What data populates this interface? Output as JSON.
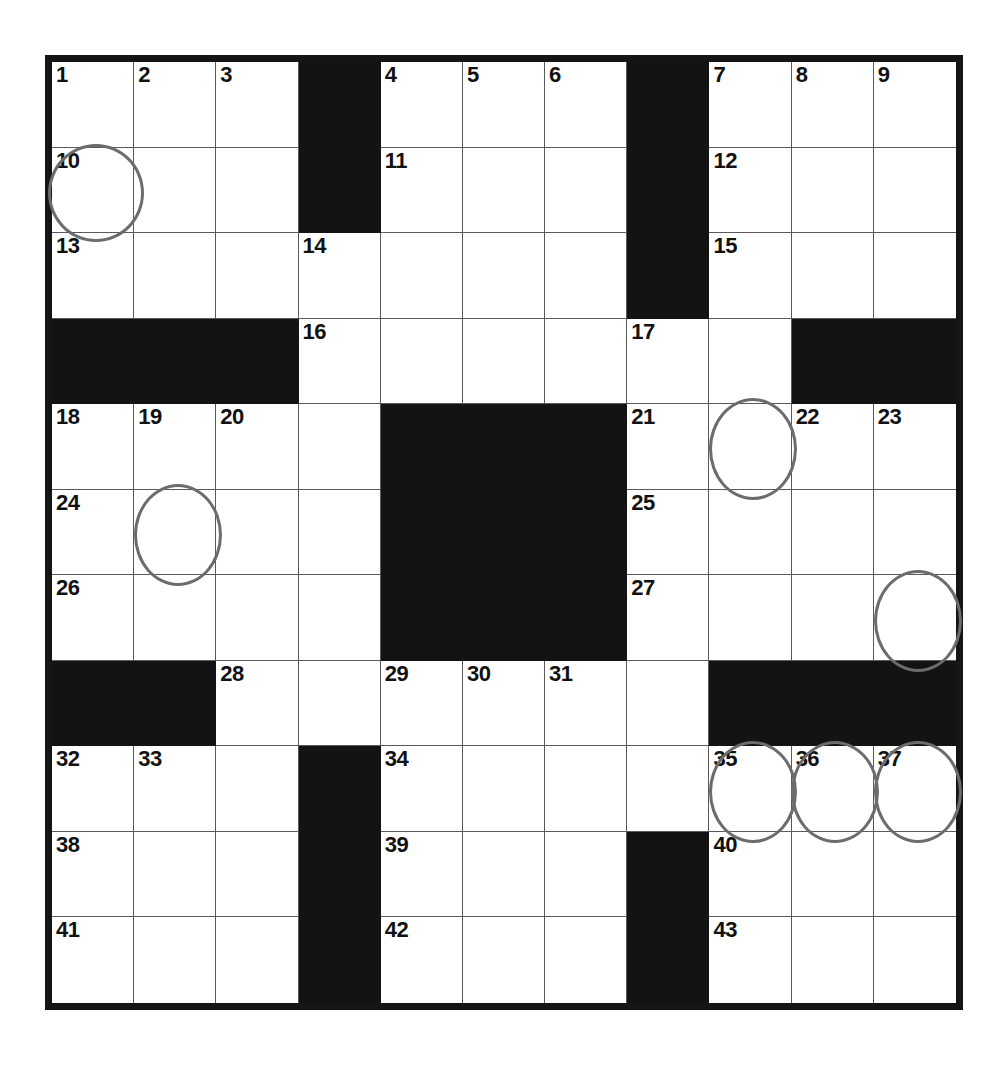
{
  "puzzle": {
    "kind": "crossword-grid",
    "title": "Crossword puzzle grid",
    "columns": 11,
    "rows": 11,
    "colors": {
      "block": "#131313",
      "cell": "#ffffff",
      "grid_line": "#5a5a5a",
      "frame": "#151515",
      "number": "#111111",
      "circle": "#6c6c6c"
    },
    "grid": [
      [
        {
          "type": "white",
          "number": "1"
        },
        {
          "type": "white",
          "number": "2"
        },
        {
          "type": "white",
          "number": "3"
        },
        {
          "type": "block",
          "number": ""
        },
        {
          "type": "white",
          "number": "4"
        },
        {
          "type": "white",
          "number": "5"
        },
        {
          "type": "white",
          "number": "6"
        },
        {
          "type": "block",
          "number": ""
        },
        {
          "type": "white",
          "number": "7"
        },
        {
          "type": "white",
          "number": "8"
        },
        {
          "type": "white",
          "number": "9"
        }
      ],
      [
        {
          "type": "white",
          "number": "10",
          "circle": true,
          "circle_style": "shift-left wide"
        },
        {
          "type": "white",
          "number": ""
        },
        {
          "type": "white",
          "number": ""
        },
        {
          "type": "block",
          "number": ""
        },
        {
          "type": "white",
          "number": "11"
        },
        {
          "type": "white",
          "number": ""
        },
        {
          "type": "white",
          "number": ""
        },
        {
          "type": "block",
          "number": ""
        },
        {
          "type": "white",
          "number": "12"
        },
        {
          "type": "white",
          "number": ""
        },
        {
          "type": "white",
          "number": ""
        }
      ],
      [
        {
          "type": "white",
          "number": "13"
        },
        {
          "type": "white",
          "number": ""
        },
        {
          "type": "white",
          "number": ""
        },
        {
          "type": "white",
          "number": "14"
        },
        {
          "type": "white",
          "number": ""
        },
        {
          "type": "white",
          "number": ""
        },
        {
          "type": "white",
          "number": ""
        },
        {
          "type": "block",
          "number": ""
        },
        {
          "type": "white",
          "number": "15"
        },
        {
          "type": "white",
          "number": ""
        },
        {
          "type": "white",
          "number": ""
        }
      ],
      [
        {
          "type": "block",
          "number": ""
        },
        {
          "type": "block",
          "number": ""
        },
        {
          "type": "block",
          "number": ""
        },
        {
          "type": "white",
          "number": "16"
        },
        {
          "type": "white",
          "number": ""
        },
        {
          "type": "white",
          "number": ""
        },
        {
          "type": "white",
          "number": ""
        },
        {
          "type": "white",
          "number": "17"
        },
        {
          "type": "white",
          "number": ""
        },
        {
          "type": "block",
          "number": ""
        },
        {
          "type": "block",
          "number": ""
        }
      ],
      [
        {
          "type": "white",
          "number": "18"
        },
        {
          "type": "white",
          "number": "19"
        },
        {
          "type": "white",
          "number": "20"
        },
        {
          "type": "white",
          "number": ""
        },
        {
          "type": "block",
          "number": ""
        },
        {
          "type": "block",
          "number": ""
        },
        {
          "type": "block",
          "number": ""
        },
        {
          "type": "white",
          "number": "21"
        },
        {
          "type": "white",
          "number": "",
          "circle": true,
          "circle_style": "shift-up tall"
        },
        {
          "type": "white",
          "number": "22"
        },
        {
          "type": "white",
          "number": "23"
        }
      ],
      [
        {
          "type": "white",
          "number": "24"
        },
        {
          "type": "white",
          "number": "",
          "circle": true,
          "circle_style": "shift-up tall"
        },
        {
          "type": "white",
          "number": ""
        },
        {
          "type": "white",
          "number": ""
        },
        {
          "type": "block",
          "number": ""
        },
        {
          "type": "block",
          "number": ""
        },
        {
          "type": "block",
          "number": ""
        },
        {
          "type": "white",
          "number": "25"
        },
        {
          "type": "white",
          "number": ""
        },
        {
          "type": "white",
          "number": ""
        },
        {
          "type": "white",
          "number": ""
        }
      ],
      [
        {
          "type": "white",
          "number": "26"
        },
        {
          "type": "white",
          "number": ""
        },
        {
          "type": "white",
          "number": ""
        },
        {
          "type": "white",
          "number": ""
        },
        {
          "type": "block",
          "number": ""
        },
        {
          "type": "block",
          "number": ""
        },
        {
          "type": "block",
          "number": ""
        },
        {
          "type": "white",
          "number": "27"
        },
        {
          "type": "white",
          "number": ""
        },
        {
          "type": "white",
          "number": ""
        },
        {
          "type": "white",
          "number": "",
          "circle": true,
          "circle_style": "shift-up shift-right tall"
        }
      ],
      [
        {
          "type": "block",
          "number": ""
        },
        {
          "type": "block",
          "number": ""
        },
        {
          "type": "white",
          "number": "28"
        },
        {
          "type": "white",
          "number": ""
        },
        {
          "type": "white",
          "number": "29"
        },
        {
          "type": "white",
          "number": "30"
        },
        {
          "type": "white",
          "number": "31"
        },
        {
          "type": "white",
          "number": ""
        },
        {
          "type": "block",
          "number": ""
        },
        {
          "type": "block",
          "number": ""
        },
        {
          "type": "block",
          "number": ""
        }
      ],
      [
        {
          "type": "white",
          "number": "32"
        },
        {
          "type": "white",
          "number": "33"
        },
        {
          "type": "white",
          "number": ""
        },
        {
          "type": "block",
          "number": ""
        },
        {
          "type": "white",
          "number": "34"
        },
        {
          "type": "white",
          "number": ""
        },
        {
          "type": "white",
          "number": ""
        },
        {
          "type": "white",
          "number": ""
        },
        {
          "type": "white",
          "number": "35",
          "circle": true,
          "circle_style": "shift-up tall"
        },
        {
          "type": "white",
          "number": "36",
          "circle": true,
          "circle_style": "shift-up tall"
        },
        {
          "type": "white",
          "number": "37",
          "circle": true,
          "circle_style": "shift-up tall"
        }
      ],
      [
        {
          "type": "white",
          "number": "38"
        },
        {
          "type": "white",
          "number": ""
        },
        {
          "type": "white",
          "number": ""
        },
        {
          "type": "block",
          "number": ""
        },
        {
          "type": "white",
          "number": "39"
        },
        {
          "type": "white",
          "number": ""
        },
        {
          "type": "white",
          "number": ""
        },
        {
          "type": "block",
          "number": ""
        },
        {
          "type": "white",
          "number": "40"
        },
        {
          "type": "white",
          "number": ""
        },
        {
          "type": "white",
          "number": ""
        }
      ],
      [
        {
          "type": "white",
          "number": "41"
        },
        {
          "type": "white",
          "number": ""
        },
        {
          "type": "white",
          "number": ""
        },
        {
          "type": "block",
          "number": ""
        },
        {
          "type": "white",
          "number": "42"
        },
        {
          "type": "white",
          "number": ""
        },
        {
          "type": "white",
          "number": ""
        },
        {
          "type": "block",
          "number": ""
        },
        {
          "type": "white",
          "number": "43"
        },
        {
          "type": "white",
          "number": ""
        },
        {
          "type": "white",
          "number": ""
        }
      ]
    ]
  }
}
